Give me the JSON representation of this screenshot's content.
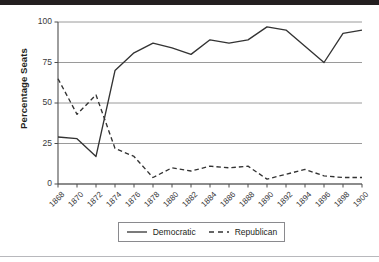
{
  "chart_data": {
    "type": "line",
    "title": "",
    "xlabel": "",
    "ylabel": "Percentage Seats",
    "x": [
      1868,
      1870,
      1872,
      1874,
      1876,
      1878,
      1880,
      1882,
      1884,
      1886,
      1888,
      1890,
      1892,
      1894,
      1896,
      1898,
      1900
    ],
    "categories": [
      "1868",
      "1870",
      "1872",
      "1874",
      "1876",
      "1878",
      "1880",
      "1882",
      "1884",
      "1886",
      "1888",
      "1890",
      "1892",
      "1894",
      "1896",
      "1898",
      "1900"
    ],
    "xlim": [
      1868,
      1900
    ],
    "ylim": [
      0,
      100
    ],
    "yticks": [
      0,
      25,
      50,
      75,
      100
    ],
    "ytick_labels": [
      "0",
      "25",
      "50",
      "75",
      "100"
    ],
    "grid": "horizontal",
    "legend_position": "bottom-center",
    "series": [
      {
        "name": "Democratic",
        "style": "solid",
        "color": "#333333",
        "values": [
          29,
          28,
          17,
          70,
          81,
          87,
          84,
          80,
          89,
          87,
          89,
          97,
          95,
          85,
          75,
          93,
          95
        ]
      },
      {
        "name": "Republican",
        "style": "dashed",
        "color": "#333333",
        "values": [
          65,
          43,
          55,
          22,
          17,
          4,
          10,
          8,
          11,
          10,
          11,
          3,
          6,
          9,
          5,
          4,
          4
        ]
      }
    ]
  },
  "legend": {
    "items": [
      {
        "label": "Democratic",
        "style": "solid"
      },
      {
        "label": "Republican",
        "style": "dashed"
      }
    ]
  },
  "colors": {
    "line": "#333333",
    "grid": "#808080",
    "axis": "#4d4d4d",
    "text": "#231f20",
    "top_bar": "#231f20",
    "bottom_rule": "#b8b8bc"
  }
}
